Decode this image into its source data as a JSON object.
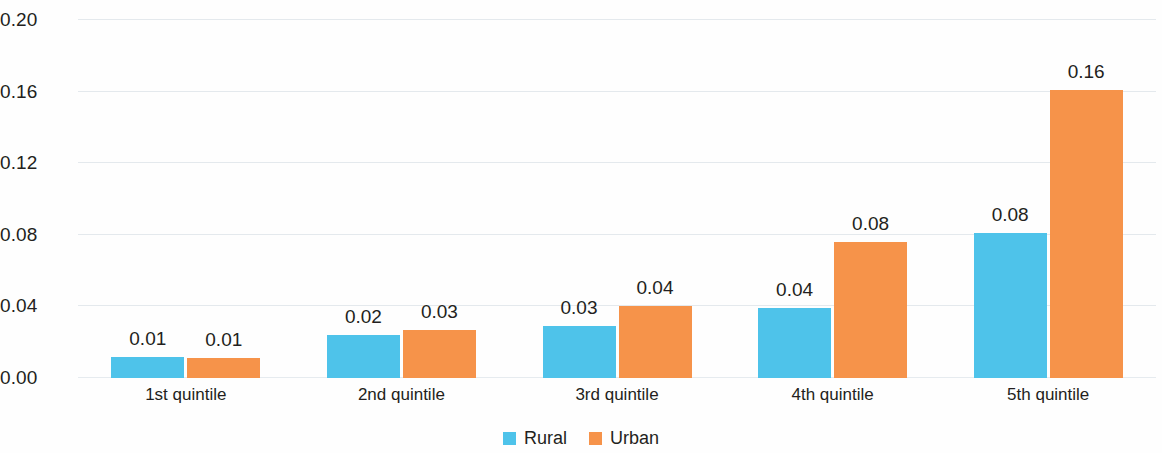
{
  "chart_data": {
    "type": "bar",
    "title": "",
    "subtitle": "",
    "xlabel": "",
    "ylabel": "",
    "categories": [
      "1st quintile",
      "2nd quintile",
      "3rd quintile",
      "4th quintile",
      "5th quintile"
    ],
    "series": [
      {
        "name": "Rural",
        "color": "#4ec3ea",
        "values": [
          0.012,
          0.024,
          0.029,
          0.039,
          0.081
        ],
        "labels": [
          "0.01",
          "0.02",
          "0.03",
          "0.04",
          "0.08"
        ]
      },
      {
        "name": "Urban",
        "color": "#f6934a",
        "values": [
          0.011,
          0.027,
          0.04,
          0.076,
          0.161
        ],
        "labels": [
          "0.01",
          "0.03",
          "0.04",
          "0.08",
          "0.16"
        ]
      }
    ],
    "ylim": [
      0.0,
      0.2
    ],
    "yticks": [
      0.0,
      0.04,
      0.08,
      0.12,
      0.16,
      0.2
    ],
    "ytick_labels": [
      "0.00",
      "0.04",
      "0.08",
      "0.12",
      "0.16",
      "0.20"
    ],
    "grid": true,
    "grid_axis": "y",
    "legend_position": "bottom-center",
    "legend": [
      "Rural",
      "Urban"
    ]
  }
}
